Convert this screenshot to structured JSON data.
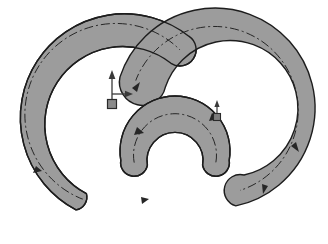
{
  "drawing": {
    "title": "Swept Arc Path Diagram",
    "canvas": {
      "width": 328,
      "height": 244,
      "background": "#ffffff"
    },
    "colors": {
      "band_fill": "#9c9c9c",
      "band_stroke": "#1d1d1d",
      "overlap_fill": "#6a6a6a",
      "centerline": "#262626",
      "marker": "#3a3a3a",
      "background": "#ffffff"
    },
    "style": {
      "band_stroke_width": 1.4,
      "centerline_width": 1.0,
      "centerline_dash": "9 3 2 3"
    },
    "bands": [
      {
        "name": "outer-arc-band",
        "label": "Outer C-shaped sweep",
        "shape": "circular-band",
        "center_x": 215,
        "center_y": 108,
        "inner_radius": 68,
        "outer_radius": 100,
        "start_angle_deg": 198,
        "end_angle_deg": 78,
        "sweep": "clockwise",
        "end_caps": "round",
        "direction_arrows": 3
      },
      {
        "name": "middle-arc-band",
        "label": "Middle U-shaped sweep",
        "shape": "circular-band",
        "center_x": 175,
        "center_y": 170,
        "inner_radius": 28,
        "outer_radius": 55,
        "start_angle_deg": 190,
        "end_angle_deg": 350,
        "sweep": "clockwise",
        "end_caps": "round",
        "direction_arrows": 2
      },
      {
        "name": "lower-left-arc-band",
        "label": "Lower left sweep",
        "shape": "circular-band",
        "center_x": 140,
        "center_y": 128,
        "inner_radius": 78,
        "outer_radius": 104,
        "start_angle_deg": 128,
        "end_angle_deg": 62,
        "sweep": "clockwise",
        "end_caps": "round",
        "direction_arrows": 2
      }
    ],
    "overlap_regions": [
      {
        "name": "band-intersection-region",
        "label": "Overlap of middle and lower-left sweeps",
        "fill": "#6a6a6a"
      }
    ],
    "markers": [
      {
        "name": "origin-datum-marker",
        "label": "Global coordinate origin",
        "x": 112,
        "y": 104,
        "type": "axis-triad",
        "axes": [
          "y-up",
          "x-right"
        ],
        "square_size": 9
      },
      {
        "name": "secondary-datum-marker",
        "label": "Local coordinate datum",
        "x": 217,
        "y": 117,
        "type": "axis-triad",
        "axes": [
          "y-up",
          "x-right"
        ],
        "square_size": 7
      }
    ]
  }
}
